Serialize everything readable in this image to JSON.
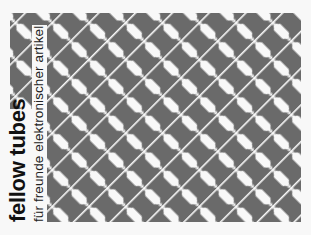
{
  "brand": {
    "title": "fellow tubes",
    "subtitle": "für freunde elektronischer artikel"
  },
  "colors": {
    "pattern_gray": "#6a6a6a",
    "pattern_white": "#f8f8f8",
    "text": "#111111"
  },
  "icons": {
    "pattern": "diagonal-hexagon-lattice"
  }
}
